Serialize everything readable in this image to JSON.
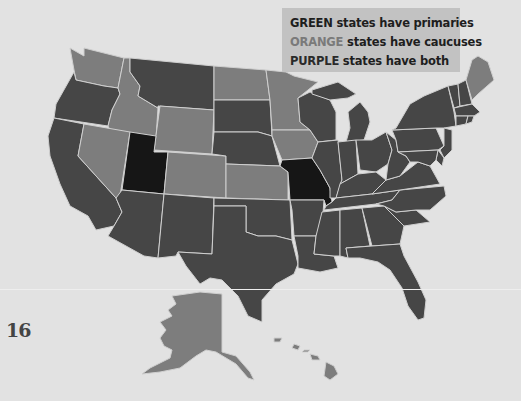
{
  "legend": {
    "rows": [
      {
        "key": "GREEN",
        "text": " states have primaries",
        "meaning": "primaries"
      },
      {
        "key": "ORANGE",
        "text": " states have caucuses",
        "meaning": "caucuses"
      },
      {
        "key": "PURPLE",
        "text": " states have both",
        "meaning": "both"
      }
    ]
  },
  "page_number": "16",
  "colors": {
    "background": "#e2e2e2",
    "primaries_state": "#464646",
    "caucuses_state": "#7d7d7d",
    "both_state": "#161616",
    "state_border": "#cfcfcf",
    "legend_box": "#c2c2c2"
  },
  "map": {
    "title": "U.S. states by nominating contest type",
    "states": {
      "WA": "caucuses",
      "OR": "primaries",
      "CA": "primaries",
      "ID": "caucuses",
      "NV": "caucuses",
      "MT": "primaries",
      "WY": "caucuses",
      "UT": "both",
      "AZ": "primaries",
      "CO": "caucuses",
      "NM": "primaries",
      "ND": "caucuses",
      "SD": "primaries",
      "NE": "primaries",
      "KS": "caucuses",
      "OK": "primaries",
      "TX": "primaries",
      "MN": "caucuses",
      "IA": "caucuses",
      "MO": "both",
      "AR": "primaries",
      "LA": "primaries",
      "WI": "primaries",
      "IL": "primaries",
      "MI": "primaries",
      "IN": "primaries",
      "OH": "primaries",
      "KY": "primaries",
      "TN": "primaries",
      "MS": "primaries",
      "AL": "primaries",
      "GA": "primaries",
      "FL": "primaries",
      "SC": "primaries",
      "NC": "primaries",
      "VA": "primaries",
      "WV": "primaries",
      "PA": "primaries",
      "NY": "primaries",
      "VT": "primaries",
      "NH": "primaries",
      "ME": "caucuses",
      "MA": "primaries",
      "CT": "primaries",
      "RI": "primaries",
      "NJ": "primaries",
      "DE": "primaries",
      "MD": "primaries",
      "AK": "caucuses",
      "HI": "caucuses"
    }
  }
}
